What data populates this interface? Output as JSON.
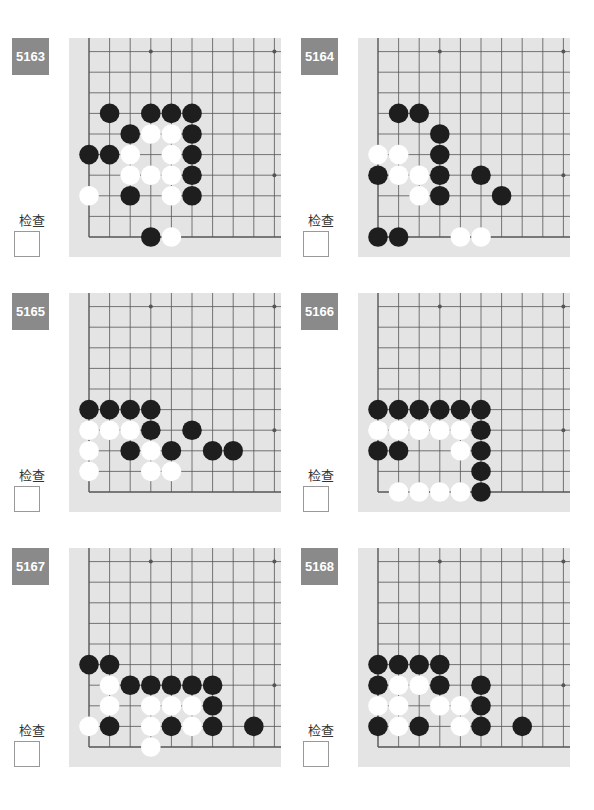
{
  "page": {
    "check_label": "检查",
    "colors": {
      "badge": "#8a8a8a",
      "board": "#e4e4e4",
      "line": "#555555",
      "black": "#1e1e1e",
      "white": "#ffffff"
    }
  },
  "problems": [
    {
      "number": "5163",
      "black": [
        [
          1,
          6
        ],
        [
          3,
          6
        ],
        [
          4,
          6
        ],
        [
          5,
          6
        ],
        [
          2,
          5
        ],
        [
          5,
          5
        ],
        [
          0,
          4
        ],
        [
          1,
          4
        ],
        [
          5,
          4
        ],
        [
          5,
          3
        ],
        [
          2,
          2
        ],
        [
          5,
          2
        ],
        [
          3,
          0
        ]
      ],
      "white": [
        [
          3,
          5
        ],
        [
          4,
          5
        ],
        [
          2,
          4
        ],
        [
          4,
          4
        ],
        [
          2,
          3
        ],
        [
          3,
          3
        ],
        [
          4,
          3
        ],
        [
          0,
          2
        ],
        [
          4,
          2
        ],
        [
          4,
          0
        ]
      ]
    },
    {
      "number": "5164",
      "black": [
        [
          1,
          6
        ],
        [
          2,
          6
        ],
        [
          3,
          5
        ],
        [
          3,
          4
        ],
        [
          0,
          3
        ],
        [
          3,
          3
        ],
        [
          5,
          3
        ],
        [
          3,
          2
        ],
        [
          6,
          2
        ],
        [
          0,
          0
        ],
        [
          1,
          0
        ]
      ],
      "white": [
        [
          0,
          4
        ],
        [
          1,
          4
        ],
        [
          1,
          3
        ],
        [
          2,
          3
        ],
        [
          2,
          2
        ],
        [
          4,
          0
        ],
        [
          5,
          0
        ]
      ]
    },
    {
      "number": "5165",
      "black": [
        [
          0,
          4
        ],
        [
          1,
          4
        ],
        [
          2,
          4
        ],
        [
          3,
          4
        ],
        [
          3,
          3
        ],
        [
          5,
          3
        ],
        [
          2,
          2
        ],
        [
          4,
          2
        ],
        [
          6,
          2
        ],
        [
          7,
          2
        ]
      ],
      "white": [
        [
          0,
          3
        ],
        [
          1,
          3
        ],
        [
          2,
          3
        ],
        [
          0,
          2
        ],
        [
          3,
          2
        ],
        [
          0,
          1
        ],
        [
          3,
          1
        ],
        [
          4,
          1
        ]
      ]
    },
    {
      "number": "5166",
      "black": [
        [
          0,
          4
        ],
        [
          1,
          4
        ],
        [
          2,
          4
        ],
        [
          3,
          4
        ],
        [
          4,
          4
        ],
        [
          5,
          4
        ],
        [
          5,
          3
        ],
        [
          0,
          2
        ],
        [
          1,
          2
        ],
        [
          5,
          2
        ],
        [
          5,
          1
        ],
        [
          5,
          0
        ]
      ],
      "white": [
        [
          0,
          3
        ],
        [
          1,
          3
        ],
        [
          2,
          3
        ],
        [
          3,
          3
        ],
        [
          4,
          3
        ],
        [
          4,
          2
        ],
        [
          1,
          0
        ],
        [
          2,
          0
        ],
        [
          3,
          0
        ],
        [
          4,
          0
        ]
      ]
    },
    {
      "number": "5167",
      "black": [
        [
          0,
          4
        ],
        [
          1,
          4
        ],
        [
          2,
          3
        ],
        [
          3,
          3
        ],
        [
          4,
          3
        ],
        [
          5,
          3
        ],
        [
          6,
          3
        ],
        [
          6,
          2
        ],
        [
          1,
          1
        ],
        [
          4,
          1
        ],
        [
          6,
          1
        ],
        [
          8,
          1
        ]
      ],
      "white": [
        [
          1,
          3
        ],
        [
          1,
          2
        ],
        [
          3,
          2
        ],
        [
          4,
          2
        ],
        [
          5,
          2
        ],
        [
          0,
          1
        ],
        [
          3,
          1
        ],
        [
          5,
          1
        ],
        [
          3,
          0
        ]
      ]
    },
    {
      "number": "5168",
      "black": [
        [
          0,
          4
        ],
        [
          1,
          4
        ],
        [
          2,
          4
        ],
        [
          3,
          4
        ],
        [
          0,
          3
        ],
        [
          3,
          3
        ],
        [
          5,
          3
        ],
        [
          5,
          2
        ],
        [
          0,
          1
        ],
        [
          2,
          1
        ],
        [
          5,
          1
        ],
        [
          7,
          1
        ]
      ],
      "white": [
        [
          1,
          3
        ],
        [
          2,
          3
        ],
        [
          0,
          2
        ],
        [
          1,
          2
        ],
        [
          3,
          2
        ],
        [
          4,
          2
        ],
        [
          1,
          1
        ],
        [
          4,
          1
        ]
      ]
    }
  ]
}
